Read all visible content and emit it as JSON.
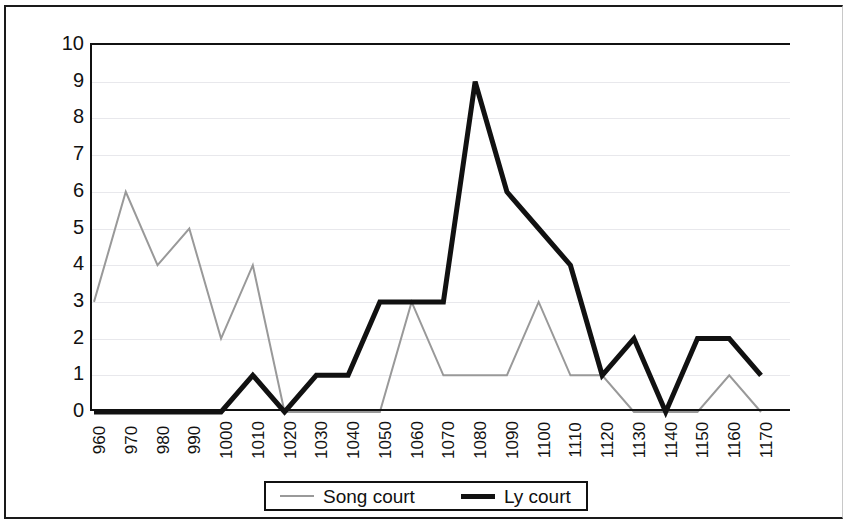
{
  "chart_data": {
    "type": "line",
    "title": "",
    "xlabel": "",
    "ylabel": "",
    "ylim": [
      0,
      10
    ],
    "ytick_values": [
      10,
      9,
      8,
      7,
      6,
      5,
      4,
      3,
      2,
      1,
      0
    ],
    "grid": true,
    "legend_position": "bottom",
    "categories": [
      "960",
      "970",
      "980",
      "990",
      "1000",
      "1010",
      "1020",
      "1030",
      "1040",
      "1050",
      "1060",
      "1070",
      "1080",
      "1090",
      "1100",
      "1110",
      "1120",
      "1130",
      "1140",
      "1150",
      "1160",
      "1170"
    ],
    "series": [
      {
        "name": "Song court",
        "color": "#999999",
        "width": 2,
        "values": [
          3,
          6,
          4,
          5,
          2,
          4,
          0,
          0,
          0,
          0,
          3,
          1,
          1,
          1,
          3,
          1,
          1,
          0,
          0,
          0,
          1,
          0
        ]
      },
      {
        "name": "Ly court",
        "color": "#111111",
        "width": 5,
        "values": [
          0,
          0,
          0,
          0,
          0,
          1,
          0,
          1,
          1,
          3,
          3,
          3,
          9,
          6,
          5,
          4,
          1,
          2,
          0,
          2,
          2,
          1
        ]
      }
    ]
  },
  "legend": {
    "entries": [
      {
        "label": "Song court"
      },
      {
        "label": "Ly court"
      }
    ]
  }
}
